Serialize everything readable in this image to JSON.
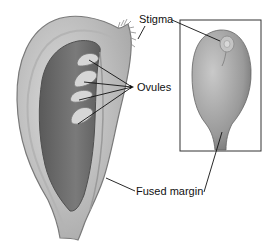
{
  "figure": {
    "labels": {
      "stigma": "Stigma",
      "ovules": "Ovules",
      "fused_margin": "Fused margin"
    },
    "colors": {
      "outer_wall": "#c8c8c8",
      "wall_edge": "#8a8a8a",
      "cavity": "#6e6e6e",
      "ovule": "#d6d6d6",
      "inset_body": "#a6a6a6",
      "line": "#111111"
    }
  }
}
